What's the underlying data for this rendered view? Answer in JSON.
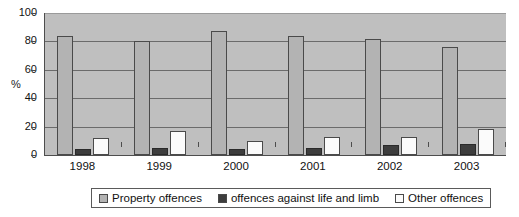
{
  "chart_data": {
    "type": "bar",
    "title": "",
    "subtitle": "",
    "xlabel": "",
    "ylabel": "%",
    "ylim": [
      0,
      100
    ],
    "yticks": [
      0,
      20,
      40,
      60,
      80,
      100
    ],
    "grid": true,
    "legend_position": "bottom",
    "categories": [
      "1998",
      "1999",
      "2000",
      "2001",
      "2002",
      "2003"
    ],
    "series": [
      {
        "name": "Property offences",
        "color": "#b3b3b3",
        "values": [
          84,
          80,
          87,
          84,
          82,
          76
        ]
      },
      {
        "name": "offences against life and limb",
        "color": "#3d3d3d",
        "values": [
          4,
          5,
          4,
          5,
          7,
          8
        ]
      },
      {
        "name": "Other offences",
        "color": "#fbfbfb",
        "values": [
          12,
          17,
          10,
          13,
          13,
          18
        ]
      }
    ]
  },
  "colors": {
    "plot_background": "#bfbfbf",
    "gridline": "#6b6b6b",
    "axis": "#4d4d4d",
    "series_property": "#b3b3b3",
    "series_life_limb": "#3d3d3d",
    "series_other": "#fbfbfb",
    "legend_border": "#5a5a5a",
    "page_background": "#ffffff"
  }
}
